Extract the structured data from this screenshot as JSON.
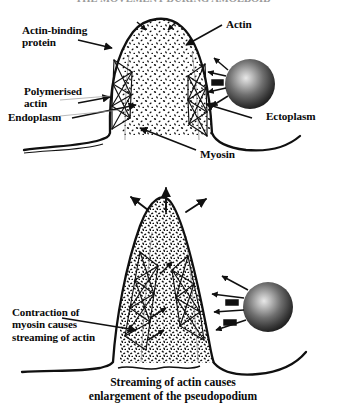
{
  "figure": {
    "title": "THE MOVEMENT DURING AMOEBOID",
    "caption_line1": "Streaming of actin causes",
    "caption_line2": "enlargement of the pseudopodium",
    "background_color": "#ffffff",
    "ink_color": "#101010"
  },
  "panels": [
    {
      "id": "upper-panel",
      "name": "pseudopodium-resting",
      "labels": [
        {
          "key": "actin_binding_protein",
          "name": "actin-binding-protein",
          "line1": "Actin-binding",
          "line2": "protein",
          "side": "left"
        },
        {
          "key": "polymerised_actin",
          "name": "polymerised-actin",
          "line1": "Polymerised",
          "line2": "actin",
          "side": "left"
        },
        {
          "key": "endoplasm",
          "name": "endoplasm",
          "line1": "Endoplasm",
          "line2": "",
          "side": "left"
        },
        {
          "key": "actin",
          "name": "actin",
          "line1": "Actin",
          "line2": "",
          "side": "right"
        },
        {
          "key": "ectoplasm",
          "name": "ectoplasm",
          "line1": "Ectoplasm",
          "line2": "",
          "side": "right"
        },
        {
          "key": "myosin",
          "name": "myosin",
          "line1": "Myosin",
          "line2": "",
          "side": "bottom"
        }
      ]
    },
    {
      "id": "lower-panel",
      "name": "pseudopodium-extending",
      "labels": [
        {
          "key": "contraction_note",
          "name": "contraction-of-myosin-note",
          "line1": "Contraction of",
          "line2": "myosin causes",
          "line3": "streaming of actin",
          "side": "left"
        }
      ],
      "arrows": [
        {
          "name": "growth-arrow-up-left",
          "direction": "up-left"
        },
        {
          "name": "growth-arrow-up",
          "direction": "up"
        },
        {
          "name": "growth-arrow-up-right",
          "direction": "up-right"
        }
      ]
    }
  ],
  "legend_structures": {
    "nucleus_sphere": "dark-sphere-organelle",
    "membrane": "cell-membrane-outline",
    "stipple": "actin-granule-stipple",
    "mesh": "actin-filament-mesh"
  }
}
